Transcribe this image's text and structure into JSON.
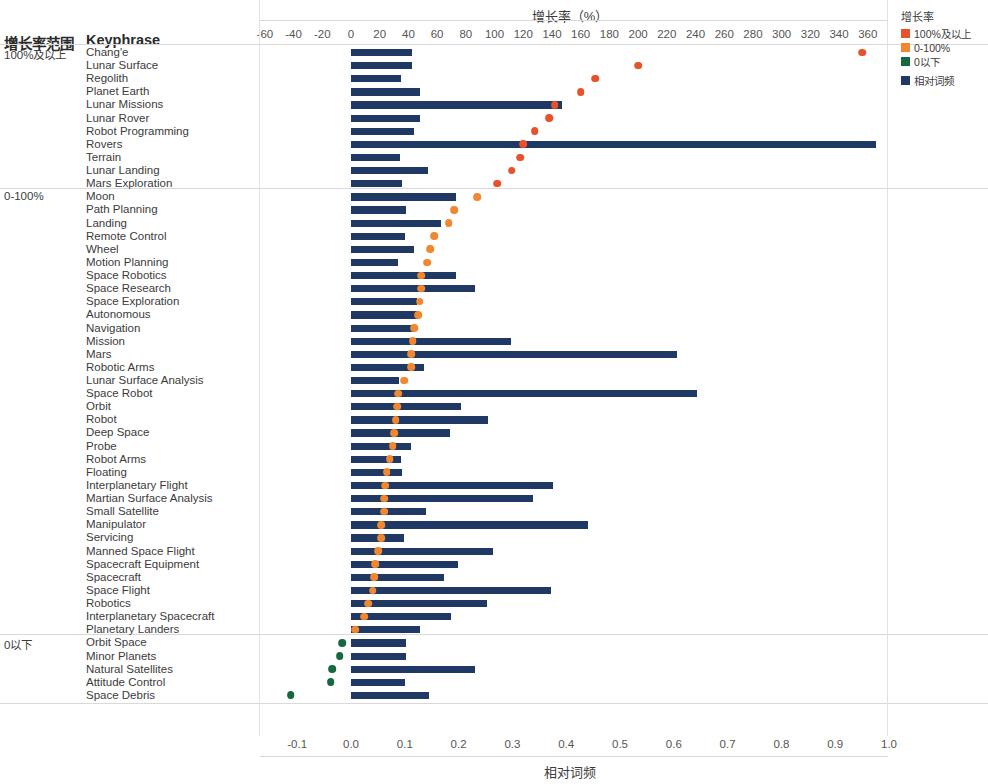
{
  "header": {
    "group_column": "增长率范围",
    "keyphrase_column": "Keyphrase"
  },
  "legend": {
    "title": "增长率",
    "items": [
      {
        "label": "100%及以上",
        "color": "#e8512a"
      },
      {
        "label": "0-100%",
        "color": "#f1882f"
      },
      {
        "label": "0以下",
        "color": "#16683f"
      },
      {
        "label": "相对词频",
        "color": "#1f3864"
      }
    ]
  },
  "chart_data": {
    "type": "bar",
    "title": "",
    "top_axis": {
      "label": "增长率（%）",
      "ticks": [
        -60,
        -40,
        -20,
        0,
        20,
        40,
        60,
        80,
        100,
        120,
        140,
        160,
        180,
        200,
        220,
        240,
        260,
        280,
        300,
        320,
        340,
        360
      ],
      "lim": [
        -60,
        360
      ]
    },
    "bottom_axis": {
      "label": "相对词频",
      "ticks": [
        "-0.1",
        "0.0",
        "0.1",
        "0.2",
        "0.3",
        "0.4",
        "0.5",
        "0.6",
        "0.7",
        "0.8",
        "0.9",
        "1.0"
      ],
      "lim": [
        -0.1,
        1.0
      ]
    },
    "grid": false,
    "legend_position": "top-right",
    "series": [
      {
        "name": "相对词频",
        "type": "bar",
        "color": "#1f3864"
      },
      {
        "name": "增长率",
        "type": "scatter"
      }
    ],
    "groups": [
      {
        "label": "100%及以上",
        "dot_color": "#e8512a",
        "rows": [
          {
            "keyphrase": "Chang'e",
            "freq": 0.114,
            "growth": 356
          },
          {
            "keyphrase": "Lunar Surface",
            "freq": 0.113,
            "growth": 200
          },
          {
            "keyphrase": "Regolith",
            "freq": 0.093,
            "growth": 170
          },
          {
            "keyphrase": "Planet Earth",
            "freq": 0.129,
            "growth": 160
          },
          {
            "keyphrase": "Lunar Missions",
            "freq": 0.392,
            "growth": 142
          },
          {
            "keyphrase": "Lunar Rover",
            "freq": 0.128,
            "growth": 138
          },
          {
            "keyphrase": "Robot Programming",
            "freq": 0.117,
            "growth": 128
          },
          {
            "keyphrase": "Rovers",
            "freq": 0.975,
            "growth": 120
          },
          {
            "keyphrase": "Terrain",
            "freq": 0.092,
            "growth": 118
          },
          {
            "keyphrase": "Lunar Landing",
            "freq": 0.144,
            "growth": 112
          },
          {
            "keyphrase": "Mars Exploration",
            "freq": 0.094,
            "growth": 102
          }
        ]
      },
      {
        "label": "0-100%",
        "dot_color": "#f1882f",
        "rows": [
          {
            "keyphrase": "Moon",
            "freq": 0.196,
            "growth": 88
          },
          {
            "keyphrase": "Path Planning",
            "freq": 0.102,
            "growth": 72
          },
          {
            "keyphrase": "Landing",
            "freq": 0.167,
            "growth": 68
          },
          {
            "keyphrase": "Remote Control",
            "freq": 0.1,
            "growth": 58
          },
          {
            "keyphrase": "Wheel",
            "freq": 0.118,
            "growth": 55
          },
          {
            "keyphrase": "Motion Planning",
            "freq": 0.087,
            "growth": 53
          },
          {
            "keyphrase": "Space Robotics",
            "freq": 0.195,
            "growth": 49
          },
          {
            "keyphrase": "Space Research",
            "freq": 0.23,
            "growth": 49
          },
          {
            "keyphrase": "Space Exploration",
            "freq": 0.122,
            "growth": 48
          },
          {
            "keyphrase": "Autonomous",
            "freq": 0.124,
            "growth": 47
          },
          {
            "keyphrase": "Navigation",
            "freq": 0.118,
            "growth": 44
          },
          {
            "keyphrase": "Mission",
            "freq": 0.298,
            "growth": 43
          },
          {
            "keyphrase": "Mars",
            "freq": 0.606,
            "growth": 42
          },
          {
            "keyphrase": "Robotic Arms",
            "freq": 0.136,
            "growth": 42
          },
          {
            "keyphrase": "Lunar Surface Analysis",
            "freq": 0.089,
            "growth": 37
          },
          {
            "keyphrase": "Space Robot",
            "freq": 0.643,
            "growth": 33
          },
          {
            "keyphrase": "Orbit",
            "freq": 0.204,
            "growth": 32
          },
          {
            "keyphrase": "Robot",
            "freq": 0.254,
            "growth": 31
          },
          {
            "keyphrase": "Deep Space",
            "freq": 0.184,
            "growth": 30
          },
          {
            "keyphrase": "Probe",
            "freq": 0.112,
            "growth": 29
          },
          {
            "keyphrase": "Robot Arms",
            "freq": 0.093,
            "growth": 27
          },
          {
            "keyphrase": "Floating",
            "freq": 0.095,
            "growth": 25
          },
          {
            "keyphrase": "Interplanetary Flight",
            "freq": 0.375,
            "growth": 24
          },
          {
            "keyphrase": "Martian Surface Analysis",
            "freq": 0.338,
            "growth": 23
          },
          {
            "keyphrase": "Small Satellite",
            "freq": 0.139,
            "growth": 23
          },
          {
            "keyphrase": "Manipulator",
            "freq": 0.44,
            "growth": 21
          },
          {
            "keyphrase": "Servicing",
            "freq": 0.098,
            "growth": 21
          },
          {
            "keyphrase": "Manned Space Flight",
            "freq": 0.264,
            "growth": 19
          },
          {
            "keyphrase": "Spacecraft Equipment",
            "freq": 0.198,
            "growth": 17
          },
          {
            "keyphrase": "Spacecraft",
            "freq": 0.172,
            "growth": 16
          },
          {
            "keyphrase": "Space Flight",
            "freq": 0.372,
            "growth": 15
          },
          {
            "keyphrase": "Robotics",
            "freq": 0.252,
            "growth": 12
          },
          {
            "keyphrase": "Interplanetary Spacecraft",
            "freq": 0.186,
            "growth": 9
          },
          {
            "keyphrase": "Planetary Landers",
            "freq": 0.128,
            "growth": 3
          }
        ]
      },
      {
        "label": "0以下",
        "dot_color": "#16683f",
        "rows": [
          {
            "keyphrase": "Orbit Space",
            "freq": 0.102,
            "growth": -6
          },
          {
            "keyphrase": "Minor Planets",
            "freq": 0.102,
            "growth": -8
          },
          {
            "keyphrase": "Natural Satellites",
            "freq": 0.23,
            "growth": -13
          },
          {
            "keyphrase": "Attitude Control",
            "freq": 0.1,
            "growth": -14
          },
          {
            "keyphrase": "Space Debris",
            "freq": 0.145,
            "growth": -42
          }
        ]
      }
    ]
  }
}
